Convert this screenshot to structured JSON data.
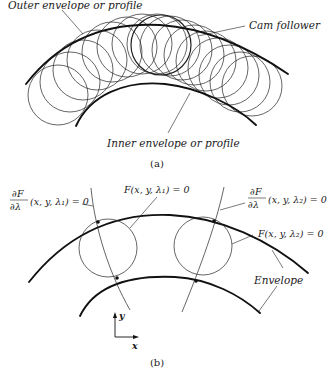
{
  "figure_a": {
    "labels": {
      "outer_envelope": "Outer envelope or profile",
      "cam_follower": "Cam follower",
      "inner_envelope": "Inner envelope or profile"
    },
    "caption": "(a)"
  },
  "figure_b": {
    "labels": {
      "dF_lambda1_num": "∂F",
      "dF_lambda1_den": "∂λ",
      "dF_lambda1_args": "(x, y, λ₁) = 0",
      "F_lambda1": "F(x, y, λ₁) = 0",
      "dF_lambda2_num": "∂F",
      "dF_lambda2_den": "∂λ",
      "dF_lambda2_args": "(x, y, λ₂) = 0",
      "F_lambda2": "F(x, y, λ₂) = 0",
      "envelope": "Envelope"
    },
    "axes": {
      "x_label": "x",
      "y_label": "y"
    },
    "caption": "(b)"
  },
  "colors": {
    "ink": "#111111",
    "background": "#ffffff"
  }
}
